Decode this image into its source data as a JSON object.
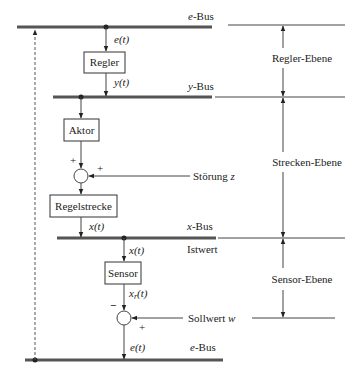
{
  "diagram": {
    "buses": {
      "e_top": {
        "label_var": "e",
        "label_suffix": "-Bus"
      },
      "y": {
        "label_var": "y",
        "label_suffix": "-Bus"
      },
      "x": {
        "label_var": "x",
        "label_suffix": "-Bus"
      },
      "e_bottom": {
        "label_var": "e",
        "label_suffix": "-Bus"
      }
    },
    "blocks": {
      "regler": "Regler",
      "aktor": "Aktor",
      "regelstrecke": "Regelstrecke",
      "sensor": "Sensor"
    },
    "signals": {
      "e_t_top": "e(t)",
      "y_t": "y(t)",
      "x_t_plant": "x(t)",
      "x_t_sensor": "x(t)",
      "xr_t_base": "x",
      "xr_t_sub": "r",
      "xr_t_rest": "(t)",
      "e_t_bottom": "e(t)"
    },
    "inputs": {
      "stoerung": {
        "text": "Störung ",
        "var": "z"
      },
      "sollwert": {
        "text": "Sollwert ",
        "var": "w"
      },
      "istwert": "Istwert"
    },
    "signs": {
      "sum1_top": "+",
      "sum1_right": "+",
      "sum2_top": "−",
      "sum2_right": "+"
    },
    "levels": {
      "regler": "Regler-Ebene",
      "strecke": "Strecken-Ebene",
      "sensor": "Sensor-Ebene"
    }
  }
}
